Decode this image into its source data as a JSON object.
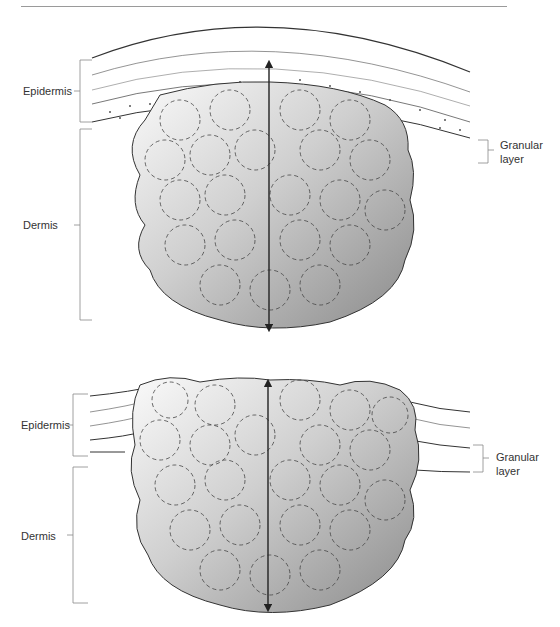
{
  "figure": {
    "panels": [
      {
        "id": "top",
        "labels": {
          "epidermis": "Epidermis",
          "dermis": "Dermis",
          "granular_layer_line1": "Granular",
          "granular_layer_line2": "layer"
        }
      },
      {
        "id": "bottom",
        "labels": {
          "epidermis": "Epidermis",
          "dermis": "Dermis",
          "granular_layer_line1": "Granular",
          "granular_layer_line2": "layer"
        }
      }
    ],
    "colors": {
      "lesion_light": "#f6f6f6",
      "lesion_dark": "#8f8f8f",
      "outline": "#333333",
      "bracket": "#888888"
    }
  }
}
